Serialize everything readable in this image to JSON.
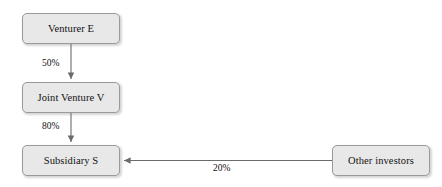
{
  "diagram": {
    "type": "ownership-structure-flow",
    "nodes": [
      {
        "id": "venturer",
        "label": "Venturer E"
      },
      {
        "id": "jv",
        "label": "Joint Venture V"
      },
      {
        "id": "subsidiary",
        "label": "Subsidiary S"
      },
      {
        "id": "other",
        "label": "Other investors"
      }
    ],
    "edges": [
      {
        "id": "venturer-to-jv",
        "from": "venturer",
        "to": "jv",
        "label": "50%",
        "direction": "down"
      },
      {
        "id": "jv-to-subsidiary",
        "from": "jv",
        "to": "subsidiary",
        "label": "80%",
        "direction": "down"
      },
      {
        "id": "other-to-subsidiary",
        "from": "other",
        "to": "subsidiary",
        "label": "20%",
        "direction": "left"
      }
    ],
    "colors": {
      "node_fill": "#e8e8e8",
      "node_border": "#9a9a9a",
      "edge_stroke": "#6b6b6b",
      "text": "#111111",
      "background": "#ffffff"
    }
  }
}
